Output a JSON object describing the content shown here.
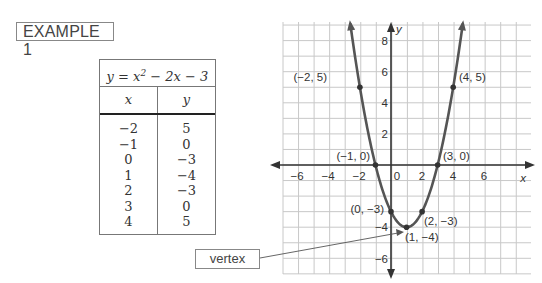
{
  "example_label": "EXAMPLE 1",
  "table": {
    "equation_prefix": "y = x",
    "equation_exp": "2",
    "equation_suffix": " − 2x − 3",
    "col_x": "x",
    "col_y": "y",
    "rows": [
      {
        "x": "−2",
        "y": "5"
      },
      {
        "x": "−1",
        "y": "0"
      },
      {
        "x": "0",
        "y": "−3"
      },
      {
        "x": "1",
        "y": "−4"
      },
      {
        "x": "2",
        "y": "−3"
      },
      {
        "x": "3",
        "y": "0"
      },
      {
        "x": "4",
        "y": "5"
      }
    ]
  },
  "vertex_label": "vertex",
  "graph": {
    "x_axis_label": "x",
    "y_axis_label": "y",
    "x_ticks": [
      "−6",
      "−4",
      "−2",
      "0",
      "2",
      "4",
      "6"
    ],
    "y_ticks": [
      "8",
      "6",
      "4",
      "2",
      "−4",
      "−6"
    ],
    "point_labels": {
      "p_m2_5": "(−2, 5)",
      "p_4_5": "(4, 5)",
      "p_m1_0": "(−1, 0)",
      "p_3_0": "(3, 0)",
      "p_0_m3": "(0, −3)",
      "p_2_m3": "(2, −3)",
      "p_1_m4": "(1, −4)"
    }
  },
  "chart_data": {
    "type": "line",
    "xlabel": "x",
    "ylabel": "y",
    "xlim": [
      -7,
      9
    ],
    "ylim": [
      -7,
      9
    ],
    "grid": true,
    "series": [
      {
        "name": "y = x^2 − 2x − 3",
        "x": [
          -2,
          -1,
          0,
          1,
          2,
          3,
          4
        ],
        "y": [
          5,
          0,
          -3,
          -4,
          -3,
          0,
          5
        ]
      }
    ],
    "annotations": [
      "(−2, 5)",
      "(4, 5)",
      "(−1, 0)",
      "(3, 0)",
      "(0, −3)",
      "(2, −3)",
      "(1, −4)",
      "vertex"
    ]
  }
}
